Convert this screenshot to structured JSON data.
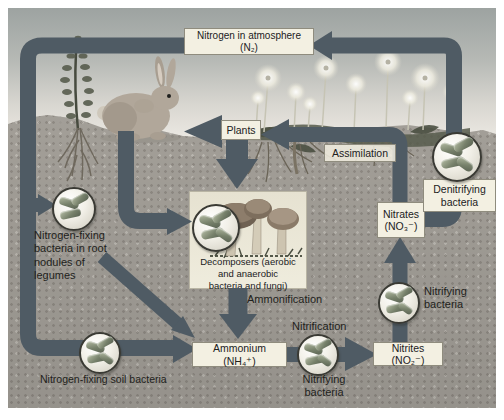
{
  "figure": {
    "labels": {
      "atmosphere": "Nitrogen in atmosphere (N₂)",
      "plants": "Plants",
      "assimilation": "Assimilation",
      "denitrifying_bacteria": "Denitrifying\nbacteria",
      "nitrates": "Nitrates\n(NO₃⁻)",
      "nodule_bacteria": "Nitrogen-fixing\nbacteria in root\nnodules of\nlegumes",
      "decomposers": "Decomposers (aerobic\nand anaerobic\nbacteria and fungi)",
      "ammonification": "Ammonification",
      "ammonium": "Ammonium (NH₄⁺)",
      "nitrification": "Nitrification",
      "nitrifying_bacteria_lower": "Nitrifying\nbacteria",
      "nitrifying_bacteria_upper": "Nitrifying\nbacteria",
      "nitrites": "Nitrites (NO₂⁻)",
      "soil_bacteria": "Nitrogen-fixing soil bacteria"
    },
    "colors": {
      "arrow": "#4f5b64",
      "label_box_bg": "#f3f0e2",
      "label_box_border": "#8f8c7e",
      "decomposers_box_bg": "#e8e4d4",
      "sky_top": "#9da3a1",
      "sky_horizon": "#ebe8e2",
      "soil": "#a6a29b",
      "text": "#1f1f1c",
      "bacteria_rod": "#77816b"
    }
  }
}
